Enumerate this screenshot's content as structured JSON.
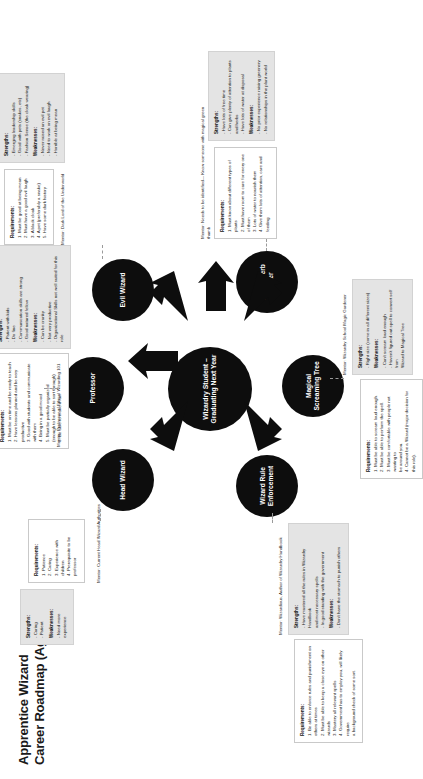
{
  "title": {
    "line1": "Apprentice Wizard",
    "line2": "Career Roadmap (Age 17)"
  },
  "center_node": {
    "label": "Wizardry Student – Graduating Next Year"
  },
  "labels": {
    "requirements_header": "Requirements:",
    "strengths_header": "Strengths:",
    "weaknesses_header": "Weaknesses:"
  },
  "careers": [
    {
      "id": "head-wizard",
      "node_label": "Head Wizard",
      "mentor": "Mentor: Current Head Wizard Authorities",
      "requirements": [
        "1. Patience",
        "2. Caring",
        "3. Experience with children",
        "4. Prerequisite to be professor"
      ],
      "strengths": [
        "- Caring",
        "- Patient"
      ],
      "weaknesses": [
        "- Need more experience"
      ]
    },
    {
      "id": "professor",
      "node_label": "Professor",
      "mentor": "Mentor: Professor of Ethical Wizarding 101",
      "requirements": [
        "1. Must be on time and be ready to teach",
        "2. Have lessons planned and be very productive",
        "3. Good with students and communicate with them",
        "4. Being in a good mood",
        "5. Must be partially organized",
        "(enough to be able to sort through)",
        "6. Be able to make it fun"
      ],
      "strengths": [
        "- Patient with kids",
        "- Do fine",
        "- Communication skills are strong",
        "- Good natured fellow"
      ],
      "weaknesses": [
        "- Can be cranky",
        "- Not very productive",
        "- Organizational Skills not well suited for this role"
      ]
    },
    {
      "id": "evil-wizard",
      "node_label": "Evil Wizard",
      "mentor": "Mentor: Dark Lord of the Underworld",
      "requirements": [
        "1. Must be good at being mean",
        "2. Must have a good evil laugh",
        "3. A black cloak",
        "4. A pet (preferably a snake)",
        "5. Have some dark history"
      ],
      "strengths": [
        "- Emerging leadership skills",
        "- Good with pets (snakes, etc)",
        "- Fashion Sense (the cloak wearing)"
      ],
      "weaknesses": [
        "- Never raised an evil pet",
        "- Need to work on evil laugh",
        "- Horrible at being mean"
      ]
    },
    {
      "id": "magic-herb-maker",
      "node_label": "Magic Herb Maker",
      "mentor": "Mentor: Needs to be identified— Know someone with magical green thumb",
      "requirements": [
        "1. Must know about different types of plants",
        "2. Must have room to care for every one of them",
        "3. Lots of water to nourish them",
        "4. Give them lots of attention, care and feeding"
      ],
      "strengths": [
        "- Have lots of free time",
        "- Can give plenty of attention to plants and herbs",
        "- Have lots of water at disposal"
      ],
      "weaknesses": [
        "- No prior experience raising greenery",
        "- No relationships in the plant world"
      ]
    },
    {
      "id": "magical-screaming-tree",
      "node_label": "Magical Screaming Tree",
      "mentor": "Mentor: Wizardry School Magic Gardener",
      "requirements": [
        "1. Must be able to scream loud enough.",
        "2. Must be able to perform the spell.",
        "3. Must be comfortable with people not wanting to",
        "be around you.",
        "4. Cannot be a Wizard (major decision for this role)."
      ],
      "strengths": [
        "- Right size (come in all different sizes)"
      ],
      "weaknesses": [
        "- Can't scream loud enough",
        "- Haven't figured out spell to convert self from",
        "Wizard to Magical Tree"
      ]
    },
    {
      "id": "wizard-rule-enforcement",
      "node_label": "Wizard Rule Enforcement",
      "mentor": "Mentor: Wizardious, Author of Wizardry Handbook",
      "requirements": [
        "1. Be able to enforce rules and punishment on",
        "others at times",
        "2. Must be able to keep a close eye on other wizards",
        "3. Mastery all relevant spells",
        "4. Government has to employ you, will likely require",
        "a background check of some sort."
      ],
      "strengths": [
        "- Have mastered all the rules in Wizardry Handbook",
        "and most necessary spells",
        "- In good standing with the government"
      ],
      "weaknesses": [
        "- Don't have the stomach to punish others"
      ]
    }
  ],
  "colors": {
    "node_fill": "#0d0d0d",
    "node_text": "#ffffff",
    "strength_panel": "#e4e4e4",
    "req_panel": "#ffffff",
    "border": "#c9c9c9"
  }
}
